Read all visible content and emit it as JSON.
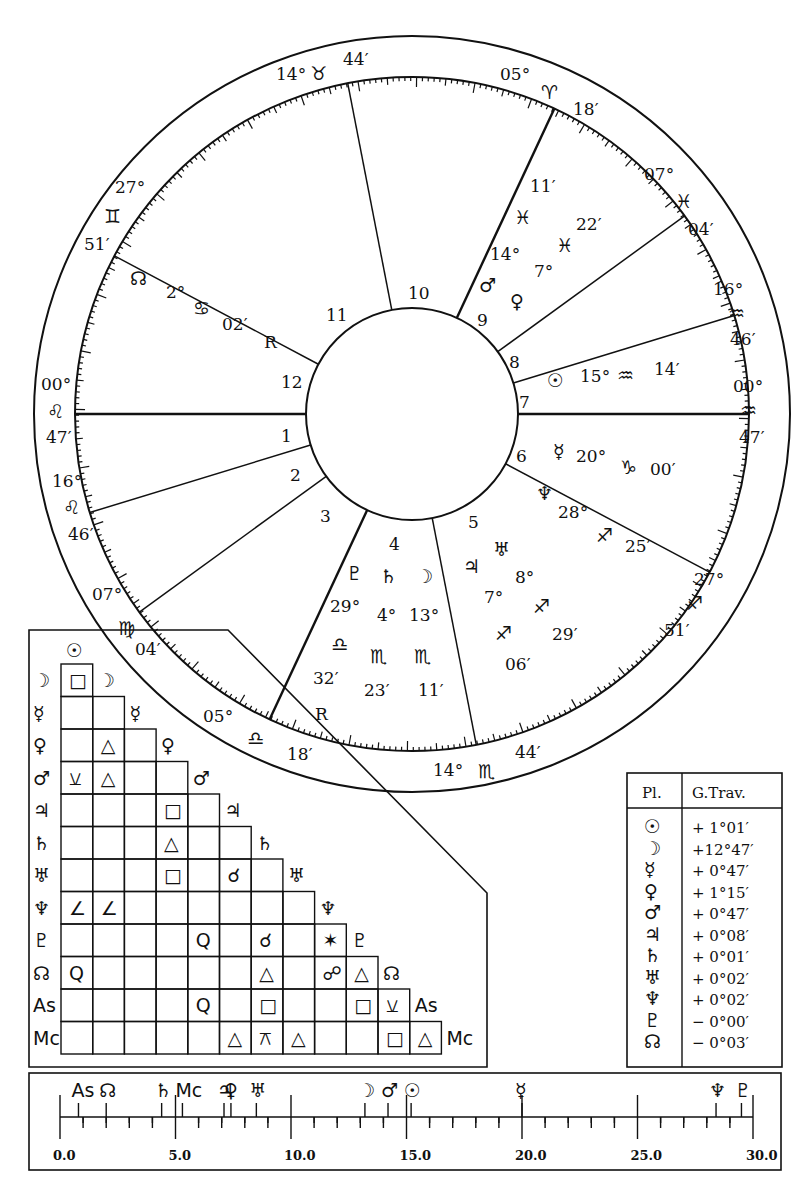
{
  "wheel": {
    "house_cusps": [
      {
        "house": "1",
        "deg": "00°",
        "sign": "♌",
        "min": "47′"
      },
      {
        "house": "2",
        "deg": "16°",
        "sign": "♌",
        "min": "46′"
      },
      {
        "house": "3",
        "deg": "07°",
        "sign": "♍",
        "min": "04′"
      },
      {
        "house": "4",
        "deg": "05°",
        "sign": "♎",
        "min": "18′"
      },
      {
        "house": "5",
        "deg": "14°",
        "sign": "♏",
        "min": "44′"
      },
      {
        "house": "6",
        "deg": "27°",
        "sign": "♐",
        "min": "51′"
      },
      {
        "house": "7",
        "deg": "00°",
        "sign": "♒",
        "min": "47′"
      },
      {
        "house": "8",
        "deg": "16°",
        "sign": "♒",
        "min": "46′"
      },
      {
        "house": "9",
        "deg": "07°",
        "sign": "♓",
        "min": "04′"
      },
      {
        "house": "10",
        "deg": "05°",
        "sign": "♈",
        "min": "18′"
      },
      {
        "house": "11",
        "deg": "14°",
        "sign": "♉",
        "min": "44′"
      },
      {
        "house": "12",
        "deg": "27°",
        "sign": "♊",
        "min": "51′"
      }
    ],
    "house_numbers": [
      "1",
      "2",
      "3",
      "4",
      "5",
      "6",
      "7",
      "8",
      "9",
      "10",
      "11",
      "12"
    ],
    "planets": [
      {
        "name": "Sun",
        "glyph": "☉",
        "deg": "15°",
        "sign": "♒",
        "min": "14′",
        "retro": ""
      },
      {
        "name": "Mercury",
        "glyph": "☿",
        "deg": "20°",
        "sign": "♑",
        "min": "00′",
        "retro": ""
      },
      {
        "name": "Neptune",
        "glyph": "♆",
        "deg": "28°",
        "sign": "♐",
        "min": "25′",
        "retro": ""
      },
      {
        "name": "Uranus",
        "glyph": "♅",
        "deg": "8°",
        "sign": "♐",
        "min": "29′",
        "retro": ""
      },
      {
        "name": "Jupiter",
        "glyph": "♃",
        "deg": "7°",
        "sign": "♐",
        "min": "06′",
        "retro": ""
      },
      {
        "name": "Moon",
        "glyph": "☽",
        "deg": "13°",
        "sign": "♏",
        "min": "11′",
        "retro": ""
      },
      {
        "name": "Saturn",
        "glyph": "♄",
        "deg": "4°",
        "sign": "♏",
        "min": "23′",
        "retro": ""
      },
      {
        "name": "Pluto",
        "glyph": "♇",
        "deg": "29°",
        "sign": "♎",
        "min": "32′",
        "retro": "R"
      },
      {
        "name": "Node",
        "glyph": "☊",
        "deg": "2°",
        "sign": "♋",
        "min": "02′",
        "retro": "R"
      },
      {
        "name": "Mars",
        "glyph": "♂",
        "deg": "14°",
        "sign": "♓",
        "min": "11′",
        "retro": ""
      },
      {
        "name": "Venus",
        "glyph": "♀",
        "deg": "7°",
        "sign": "♓",
        "min": "22′",
        "retro": ""
      }
    ]
  },
  "aspect_grid": {
    "rows": [
      "☉",
      "☽",
      "☿",
      "♀",
      "♂",
      "♃",
      "♄",
      "♅",
      "♆",
      "♇",
      "☊",
      "As",
      "Mc"
    ],
    "cells": [
      [
        "☽",
        0,
        "□"
      ],
      [
        "♀",
        1,
        "△"
      ],
      [
        "♂",
        0,
        "⚺"
      ],
      [
        "♂",
        1,
        "△"
      ],
      [
        "♃",
        3,
        "□"
      ],
      [
        "♄",
        3,
        "△"
      ],
      [
        "♅",
        3,
        "□"
      ],
      [
        "♅",
        5,
        "☌"
      ],
      [
        "♆",
        0,
        "∠"
      ],
      [
        "♆",
        1,
        "∠"
      ],
      [
        "♇",
        4,
        "Q"
      ],
      [
        "♇",
        6,
        "☌"
      ],
      [
        "♇",
        8,
        "✶"
      ],
      [
        "☊",
        0,
        "Q"
      ],
      [
        "☊",
        6,
        "△"
      ],
      [
        "☊",
        8,
        "☍"
      ],
      [
        "☊",
        9,
        "△"
      ],
      [
        "As",
        4,
        "Q"
      ],
      [
        "As",
        6,
        "□"
      ],
      [
        "As",
        9,
        "□"
      ],
      [
        "As",
        10,
        "⚺"
      ],
      [
        "Mc",
        5,
        "△"
      ],
      [
        "Mc",
        6,
        "⚻"
      ],
      [
        "Mc",
        7,
        "△"
      ],
      [
        "Mc",
        10,
        "□"
      ],
      [
        "Mc",
        11,
        "△"
      ]
    ]
  },
  "travel_table": {
    "headers": [
      "Pl.",
      "G.Trav."
    ],
    "rows": [
      {
        "glyph": "☉",
        "value": "+ 1°01′"
      },
      {
        "glyph": "☽",
        "value": "+12°47′"
      },
      {
        "glyph": "☿",
        "value": "+ 0°47′"
      },
      {
        "glyph": "♀",
        "value": "+ 1°15′"
      },
      {
        "glyph": "♂",
        "value": "+ 0°47′"
      },
      {
        "glyph": "♃",
        "value": "+ 0°08′"
      },
      {
        "glyph": "♄",
        "value": "+ 0°01′"
      },
      {
        "glyph": "♅",
        "value": "+ 0°02′"
      },
      {
        "glyph": "♆",
        "value": "+ 0°02′"
      },
      {
        "glyph": "♇",
        "value": "− 0°00′"
      },
      {
        "glyph": "☊",
        "value": "− 0°03′"
      }
    ]
  },
  "dial": {
    "ticks": [
      "0.0",
      "5.0",
      "10.0",
      "15.0",
      "20.0",
      "25.0",
      "30.0"
    ],
    "markers": [
      {
        "glyph": "As",
        "pos": 0.8
      },
      {
        "glyph": "☊",
        "pos": 2.0
      },
      {
        "glyph": "♄",
        "pos": 4.4
      },
      {
        "glyph": "Mc",
        "pos": 5.3
      },
      {
        "glyph": "♃",
        "pos": 7.1
      },
      {
        "glyph": "♀",
        "pos": 7.4
      },
      {
        "glyph": "♅",
        "pos": 8.5
      },
      {
        "glyph": "☽",
        "pos": 13.2
      },
      {
        "glyph": "♂",
        "pos": 14.2
      },
      {
        "glyph": "☉",
        "pos": 15.2
      },
      {
        "glyph": "☿",
        "pos": 20.0
      },
      {
        "glyph": "♆",
        "pos": 28.4
      },
      {
        "glyph": "♇",
        "pos": 29.5
      }
    ]
  }
}
